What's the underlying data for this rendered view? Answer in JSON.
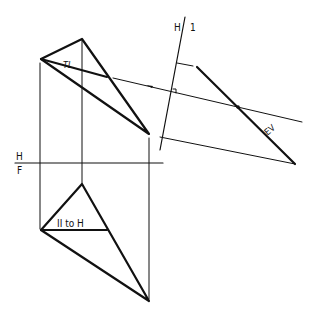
{
  "diagram": {
    "labels": {
      "fold_hf_top": "H",
      "fold_hf_bottom": "F",
      "fold_h1_left": "H",
      "fold_h1_right": "1",
      "true_length": "TL",
      "parallel_to_h": "II to H",
      "edge_view": "EV"
    },
    "views": {
      "top": {
        "points": [
          [
            41,
            59
          ],
          [
            82,
            39
          ],
          [
            149,
            134
          ]
        ],
        "tl_line_end": [
          107,
          77
        ]
      },
      "front": {
        "points": [
          [
            82,
            184
          ],
          [
            41,
            230
          ],
          [
            149,
            301
          ]
        ],
        "horizontal_line_end": [
          107,
          230
        ]
      },
      "auxiliary": {
        "edge_view": [
          [
            197,
            67
          ],
          [
            295,
            164
          ]
        ],
        "point_on_edge": [
          238,
          107
        ]
      }
    },
    "colors": {
      "line": "#111111",
      "background": "#ffffff"
    }
  }
}
